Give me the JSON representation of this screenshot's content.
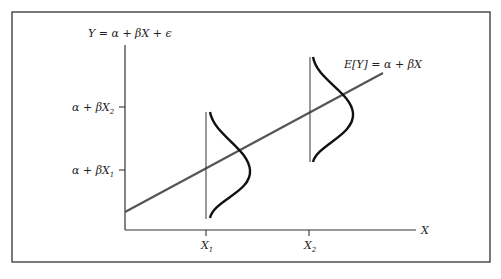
{
  "diagram": {
    "title_equation": "Y = α + βX + ϵ",
    "regression_line_label": "E[Y] = α + βX",
    "x_axis_label": "X",
    "x_ticks": [
      {
        "base": "X",
        "sub": "1"
      },
      {
        "base": "X",
        "sub": "2"
      }
    ],
    "y_ticks": [
      {
        "base": "α + βX",
        "sub": "2"
      },
      {
        "base": "α + βX",
        "sub": "1"
      }
    ]
  },
  "colors": {
    "frame": "#333333",
    "axes": "#333333",
    "regression_line": "#555555",
    "density_curves": "#111111"
  }
}
